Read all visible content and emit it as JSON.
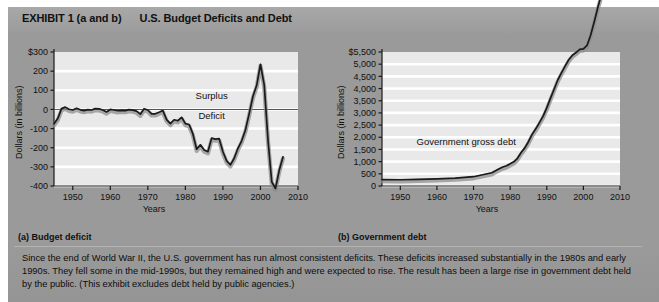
{
  "exhibit": {
    "label": "EXHIBIT 1 (a and b)",
    "title": "U.S. Budget Deficits and Debt",
    "caption": "Since the end of World War II, the U.S. government has run almost consistent deficits. These deficits increased substantially in the 1980s and early 1990s. They fell some in the mid-1990s, but they remained high and were expected to rise. The result has been a large rise in government debt held by the public. (This exhibit excludes debt held by public agencies.)"
  },
  "panel_a": {
    "subcaption": "(a) Budget deficit",
    "ylabel": "Dollars (in billions)",
    "xlabel": "Years",
    "annotation_surplus": "Surplus",
    "annotation_deficit": "Deficit"
  },
  "panel_b": {
    "subcaption": "(b) Government debt",
    "ylabel": "Dollars (in billions)",
    "xlabel": "Years",
    "annotation_series": "Government gross debt"
  },
  "colors": {
    "page_background": "#9a9a9a",
    "plot_background": "#e9e9e9",
    "gridline": "#ffffff",
    "data_line": "#1a1a1a",
    "shadow_band": "#8e8e8e",
    "axis": "#1a1a1a",
    "text": "#111111"
  },
  "chart_data": [
    {
      "type": "line",
      "id": "budget-deficit",
      "title": "(a) Budget deficit",
      "xlabel": "Years",
      "ylabel": "Dollars (in billions)",
      "xlim": [
        1945,
        2010
      ],
      "ylim": [
        -400,
        300
      ],
      "xticks": [
        1950,
        1960,
        1970,
        1980,
        1990,
        2000,
        2010
      ],
      "yticks": [
        300,
        200,
        100,
        0,
        -100,
        -200,
        -300,
        -400
      ],
      "ytick_labels": [
        "$300",
        "200",
        "100",
        "0",
        "-100",
        "-200",
        "-300",
        "-400"
      ],
      "grid": true,
      "legend": "none",
      "annotations": [
        {
          "text": "Surplus",
          "x": 1987,
          "y": 70
        },
        {
          "text": "Deficit",
          "x": 1987,
          "y": -35
        }
      ],
      "zero_line": 0,
      "series": [
        {
          "name": "Federal budget surplus/deficit",
          "x": [
            1945,
            1946,
            1947,
            1948,
            1949,
            1950,
            1951,
            1952,
            1953,
            1954,
            1955,
            1956,
            1957,
            1958,
            1959,
            1960,
            1961,
            1962,
            1963,
            1964,
            1965,
            1966,
            1967,
            1968,
            1969,
            1970,
            1971,
            1972,
            1973,
            1974,
            1975,
            1976,
            1977,
            1978,
            1979,
            1980,
            1981,
            1982,
            1983,
            1984,
            1985,
            1986,
            1987,
            1988,
            1989,
            1990,
            1991,
            1992,
            1993,
            1994,
            1995,
            1996,
            1997,
            1998,
            1999,
            2000,
            2001,
            2002,
            2003,
            2004,
            2005,
            2006
          ],
          "values": [
            -75,
            -48,
            4,
            12,
            1,
            -3,
            6,
            -2,
            -6,
            -1,
            -3,
            4,
            3,
            -3,
            -13,
            0,
            -3,
            -7,
            -5,
            -6,
            -1,
            -4,
            -9,
            -25,
            3,
            -3,
            -23,
            -23,
            -15,
            -6,
            -53,
            -74,
            -54,
            -59,
            -41,
            -74,
            -79,
            -128,
            -208,
            -185,
            -212,
            -221,
            -150,
            -155,
            -153,
            -221,
            -269,
            -290,
            -255,
            -203,
            -164,
            -107,
            -22,
            69,
            126,
            236,
            128,
            -158,
            -378,
            -413,
            -318,
            -248
          ]
        }
      ]
    },
    {
      "type": "line",
      "id": "government-gross-debt",
      "title": "(b) Government debt",
      "xlabel": "Years",
      "ylabel": "Dollars (in billions)",
      "xlim": [
        1945,
        2010
      ],
      "ylim": [
        0,
        5500
      ],
      "xticks": [
        1950,
        1960,
        1970,
        1980,
        1990,
        2000,
        2010
      ],
      "yticks": [
        5500,
        5000,
        4500,
        4000,
        3500,
        3000,
        2500,
        2000,
        1500,
        1000,
        500,
        0
      ],
      "ytick_labels": [
        "$5,500",
        "5,000",
        "4,500",
        "4,000",
        "3,500",
        "3,000",
        "2,500",
        "2,000",
        "1,500",
        "1,000",
        "500",
        "0"
      ],
      "grid": true,
      "legend": "none",
      "annotations": [
        {
          "text": "Government gross debt",
          "x": 1968,
          "y": 1800
        }
      ],
      "series": [
        {
          "name": "Government gross debt",
          "x": [
            1945,
            1950,
            1955,
            1960,
            1965,
            1970,
            1975,
            1976,
            1977,
            1978,
            1979,
            1980,
            1981,
            1982,
            1983,
            1984,
            1985,
            1986,
            1987,
            1988,
            1989,
            1990,
            1991,
            1992,
            1993,
            1994,
            1995,
            1996,
            1997,
            1998,
            1999,
            2000,
            2001,
            2002,
            2003,
            2004,
            2005,
            2006,
            2007
          ],
          "values": [
            260,
            257,
            274,
            291,
            323,
            381,
            542,
            629,
            706,
            777,
            829,
            909,
            995,
            1137,
            1372,
            1565,
            1818,
            2120,
            2346,
            2601,
            2868,
            3206,
            3598,
            3972,
            4351,
            4643,
            4921,
            5181,
            5369,
            5478,
            5606,
            5628,
            5769,
            6198,
            6760,
            7355,
            7905,
            8451,
            9008
          ]
        }
      ]
    }
  ]
}
